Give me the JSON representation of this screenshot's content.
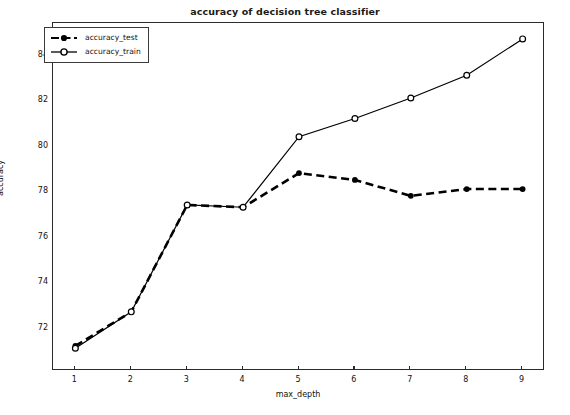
{
  "chart_data": {
    "type": "line",
    "title": "accuracy of decision tree classifier",
    "xlabel": "max_depth",
    "ylabel": "accuracy",
    "x": [
      1,
      2,
      3,
      4,
      5,
      6,
      7,
      8,
      9
    ],
    "xticks": [
      "1",
      "2",
      "3",
      "4",
      "5",
      "6",
      "7",
      "8",
      "9"
    ],
    "yticks": [
      "72",
      "74",
      "76",
      "78",
      "80",
      "82",
      "84"
    ],
    "xlim": [
      0.6,
      9.4
    ],
    "ylim": [
      70.1,
      85.4
    ],
    "grid": false,
    "legend_position": "upper left",
    "series": [
      {
        "name": "accuracy_test",
        "values": [
          71.2,
          72.7,
          77.4,
          77.3,
          78.8,
          78.5,
          77.8,
          78.1,
          78.1
        ],
        "color": "#000000",
        "linestyle": "dashed",
        "marker": "filled-circle"
      },
      {
        "name": "accuracy_train",
        "values": [
          71.1,
          72.7,
          77.4,
          77.3,
          80.4,
          81.2,
          82.1,
          83.1,
          84.7
        ],
        "color": "#000000",
        "linestyle": "solid",
        "marker": "open-circle"
      }
    ]
  },
  "legend": {
    "items": [
      {
        "label": "accuracy_test"
      },
      {
        "label": "accuracy_train"
      }
    ]
  }
}
